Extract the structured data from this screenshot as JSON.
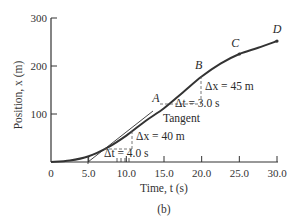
{
  "chart_data": {
    "type": "line",
    "title": "",
    "caption": "(b)",
    "xlabel": "Time, t (s)",
    "ylabel": "Position, x (m)",
    "xlim": [
      0,
      30
    ],
    "ylim": [
      0,
      300
    ],
    "x_ticks": [
      "0",
      "5.0",
      "10.0",
      "15.0",
      "20.0",
      "25.0",
      "30.0"
    ],
    "y_ticks": [
      "100",
      "200",
      "300"
    ],
    "grid": false,
    "series": [
      {
        "name": "Position vs time",
        "x": [
          0,
          2.5,
          5,
          7.5,
          10,
          12.5,
          15,
          17.5,
          20,
          22.5,
          25,
          27.5,
          30
        ],
        "y": [
          0,
          3,
          12,
          30,
          55,
          85,
          112,
          145,
          178,
          205,
          225,
          238,
          252
        ]
      }
    ],
    "points": [
      {
        "label": "A",
        "t": 15.0,
        "x": 112
      },
      {
        "label": "B",
        "t": 20.0,
        "x": 178
      },
      {
        "label": "C",
        "t": 25.0,
        "x": 225
      },
      {
        "label": "D",
        "t": 30.0,
        "x": 252
      }
    ],
    "annotations": {
      "tangent_label": "Tangent",
      "tangent_dx": "Δx = 40 m",
      "tangent_dt": "Δt = 4.0 s",
      "ab_dx": "Δx = 45 m",
      "ab_dt": "Δt = 3.0 s"
    }
  }
}
